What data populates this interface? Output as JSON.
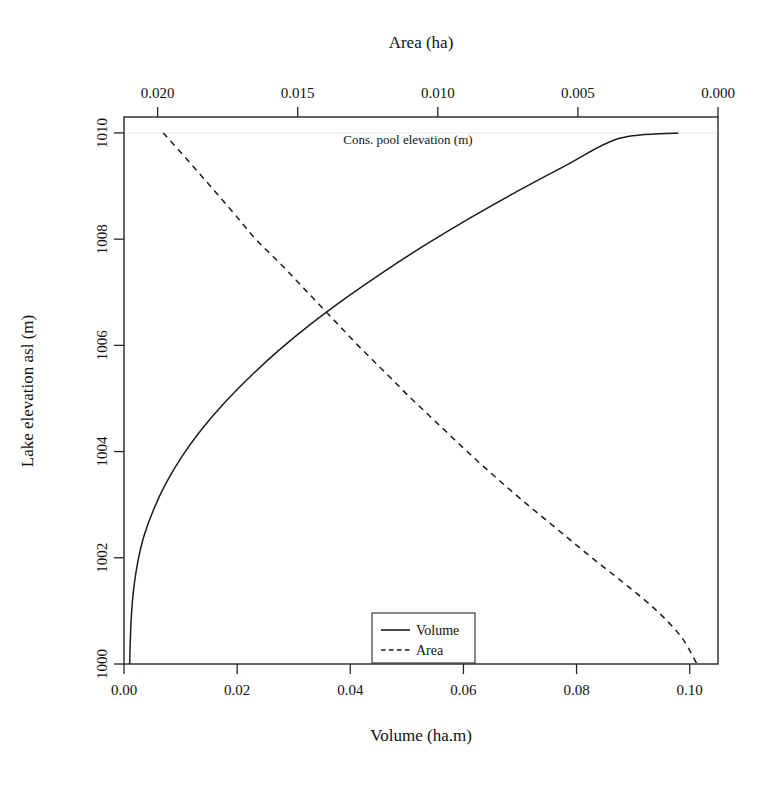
{
  "figure": {
    "background": "#ffffff",
    "line_color": "#1c1c1c",
    "frame_color": "#262626"
  },
  "axes": {
    "bottom": {
      "title": "Volume (ha.m)",
      "ticks": [
        "0.00",
        "0.02",
        "0.04",
        "0.06",
        "0.08",
        "0.10"
      ]
    },
    "top": {
      "title": "Area (ha)",
      "ticks": [
        "0.020",
        "0.015",
        "0.010",
        "0.005",
        "0.000"
      ]
    },
    "left": {
      "title": "Lake elevation asl (m)",
      "ticks": [
        "1000",
        "1002",
        "1004",
        "1006",
        "1008",
        "1010"
      ]
    }
  },
  "annotations": {
    "cons_pool": "Cons. pool elevation (m)"
  },
  "legend": {
    "items": [
      {
        "label": "Volume",
        "style": "solid"
      },
      {
        "label": "Area",
        "style": "dashed"
      }
    ]
  },
  "chart_data": {
    "type": "line",
    "title": "",
    "xlabel": "Volume (ha.m)",
    "ylabel": "Lake elevation asl (m)",
    "x2label": "Area (ha)",
    "xlim": [
      0.0,
      0.105
    ],
    "ylim": [
      1000,
      1010.3
    ],
    "x2lim": [
      0.0212,
      0.0
    ],
    "grid": false,
    "legend_position": "bottom-center-inside",
    "annotations": [
      {
        "text": "Cons. pool elevation (m)",
        "x": 0.0455,
        "y": 1010.0
      }
    ],
    "series": [
      {
        "name": "Volume",
        "style": "solid",
        "axis": "bottom",
        "xlabel": "Volume (ha.m)",
        "ylabel": "Lake elevation asl (m)",
        "points": [
          {
            "volume": 0.001,
            "elevation": 1000.0
          },
          {
            "volume": 0.0011,
            "elevation": 1000.4
          },
          {
            "volume": 0.0013,
            "elevation": 1000.9
          },
          {
            "volume": 0.0017,
            "elevation": 1001.4
          },
          {
            "volume": 0.0024,
            "elevation": 1001.9
          },
          {
            "volume": 0.0035,
            "elevation": 1002.4
          },
          {
            "volume": 0.0052,
            "elevation": 1002.9
          },
          {
            "volume": 0.0074,
            "elevation": 1003.4
          },
          {
            "volume": 0.0102,
            "elevation": 1003.9
          },
          {
            "volume": 0.0136,
            "elevation": 1004.4
          },
          {
            "volume": 0.0176,
            "elevation": 1004.9
          },
          {
            "volume": 0.0222,
            "elevation": 1005.4
          },
          {
            "volume": 0.0273,
            "elevation": 1005.9
          },
          {
            "volume": 0.033,
            "elevation": 1006.4
          },
          {
            "volume": 0.0393,
            "elevation": 1006.9
          },
          {
            "volume": 0.0461,
            "elevation": 1007.4
          },
          {
            "volume": 0.0534,
            "elevation": 1007.9
          },
          {
            "volume": 0.0612,
            "elevation": 1008.4
          },
          {
            "volume": 0.0695,
            "elevation": 1008.9
          },
          {
            "volume": 0.0783,
            "elevation": 1009.4
          },
          {
            "volume": 0.0876,
            "elevation": 1009.9
          },
          {
            "volume": 0.098,
            "elevation": 1010.0
          }
        ]
      },
      {
        "name": "Area",
        "style": "dashed",
        "axis": "top",
        "xlabel": "Area (ha)",
        "ylabel": "Lake elevation asl (m)",
        "points": [
          {
            "area": 0.0198,
            "elevation": 1010.0
          },
          {
            "area": 0.01895,
            "elevation": 1009.5
          },
          {
            "area": 0.01812,
            "elevation": 1009.0
          },
          {
            "area": 0.0173,
            "elevation": 1008.5
          },
          {
            "area": 0.0165,
            "elevation": 1008.0
          },
          {
            "area": 0.01555,
            "elevation": 1007.5
          },
          {
            "area": 0.01465,
            "elevation": 1007.0
          },
          {
            "area": 0.01375,
            "elevation": 1006.5
          },
          {
            "area": 0.01285,
            "elevation": 1006.0
          },
          {
            "area": 0.0119,
            "elevation": 1005.5
          },
          {
            "area": 0.01095,
            "elevation": 1005.0
          },
          {
            "area": 0.00995,
            "elevation": 1004.5
          },
          {
            "area": 0.00895,
            "elevation": 1004.0
          },
          {
            "area": 0.0079,
            "elevation": 1003.5
          },
          {
            "area": 0.0068,
            "elevation": 1003.0
          },
          {
            "area": 0.00565,
            "elevation": 1002.5
          },
          {
            "area": 0.0045,
            "elevation": 1002.0
          },
          {
            "area": 0.0033,
            "elevation": 1001.5
          },
          {
            "area": 0.00218,
            "elevation": 1001.0
          },
          {
            "area": 0.0013,
            "elevation": 1000.5
          },
          {
            "area": 0.00075,
            "elevation": 1000.0
          }
        ]
      }
    ],
    "intersection": {
      "volume": 0.0427,
      "area": 0.011,
      "elevation": 1007.4
    }
  }
}
